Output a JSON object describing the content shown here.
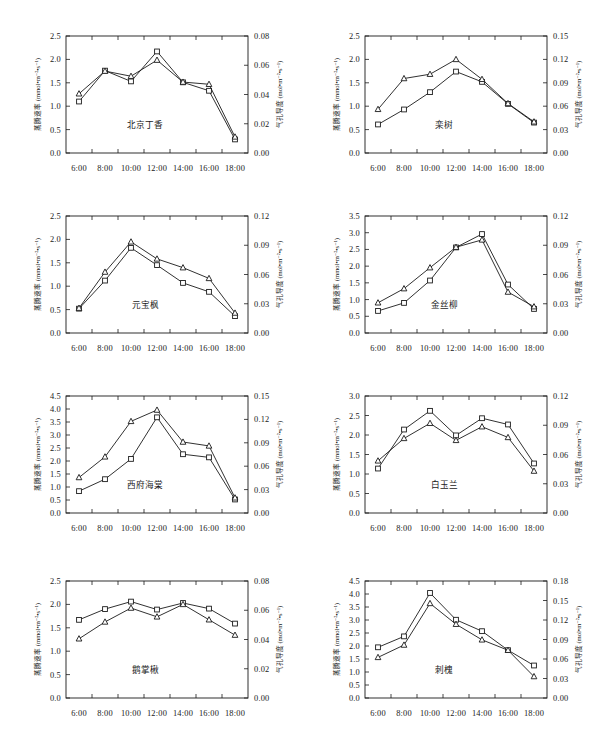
{
  "figure": {
    "axis_titles": {
      "left": "蒸腾速率 (mmol•m⁻²•s⁻¹)",
      "right": "气孔导度 (mol•m⁻²•s⁻¹)"
    },
    "x_categories": [
      "6:00",
      "8:00",
      "10:00",
      "12:00",
      "14:00",
      "16:00",
      "18:00"
    ],
    "series_names": [
      "蒸腾速率",
      "气孔导度"
    ],
    "marker_shapes": [
      "square",
      "triangle"
    ],
    "line_color": "#1a1a1a",
    "marker_fill": "#ffffff"
  },
  "chart_data": [
    {
      "type": "line",
      "title": "北京丁香",
      "xlabel": "",
      "ylabel": "蒸腾速率 (mmol•m⁻²•s⁻¹)",
      "y2label": "气孔导度 (mol•m⁻²•s⁻¹)",
      "categories": [
        "6:00",
        "8:00",
        "10:00",
        "12:00",
        "14:00",
        "16:00",
        "18:00"
      ],
      "ylim": [
        0.0,
        2.5
      ],
      "yticks": [
        "0.0",
        "0.5",
        "1.0",
        "1.5",
        "2.0",
        "2.5"
      ],
      "y2lim": [
        0.0,
        0.08
      ],
      "y2ticks": [
        "0.00",
        "0.02",
        "0.04",
        "0.06",
        "0.08"
      ],
      "grid": false,
      "legend": "none",
      "series": [
        {
          "name": "蒸腾速率",
          "marker": "square",
          "axis": "left",
          "values": [
            1.1,
            1.76,
            1.53,
            2.17,
            1.51,
            1.33,
            0.29
          ]
        },
        {
          "name": "气孔导度",
          "marker": "triangle",
          "axis": "right",
          "values": [
            0.0405,
            0.056,
            0.0525,
            0.0635,
            0.0485,
            0.047,
            0.011
          ]
        }
      ]
    },
    {
      "type": "line",
      "title": "栾树",
      "xlabel": "",
      "ylabel": "蒸腾速率 (mmol•m⁻²•s⁻¹)",
      "y2label": "气孔导度 (mol•m⁻²•s⁻¹)",
      "categories": [
        "6:00",
        "8:00",
        "10:00",
        "12:00",
        "14:00",
        "16:00",
        "18:00"
      ],
      "ylim": [
        0.0,
        2.5
      ],
      "yticks": [
        "0.0",
        "0.5",
        "1.0",
        "1.5",
        "2.0",
        "2.5"
      ],
      "y2lim": [
        0.0,
        0.15
      ],
      "y2ticks": [
        "0.00",
        "0.03",
        "0.06",
        "0.09",
        "0.12",
        "0.15"
      ],
      "grid": false,
      "legend": "none",
      "series": [
        {
          "name": "蒸腾速率",
          "marker": "square",
          "axis": "left",
          "values": [
            0.61,
            0.93,
            1.3,
            1.74,
            1.52,
            1.05,
            0.65
          ]
        },
        {
          "name": "气孔导度",
          "marker": "triangle",
          "axis": "right",
          "values": [
            0.056,
            0.0955,
            0.101,
            0.12,
            0.0945,
            0.0635,
            0.04
          ]
        }
      ]
    },
    {
      "type": "line",
      "title": "元宝枫",
      "xlabel": "",
      "ylabel": "蒸腾速率 (mmol•m⁻²•s⁻¹)",
      "y2label": "气孔导度 (mol•m⁻²•s⁻¹)",
      "categories": [
        "6:00",
        "8:00",
        "10:00",
        "12:00",
        "14:00",
        "16:00",
        "18:00"
      ],
      "ylim": [
        0.0,
        2.5
      ],
      "yticks": [
        "0.0",
        "0.5",
        "1.0",
        "1.5",
        "2.0",
        "2.5"
      ],
      "y2lim": [
        0.0,
        0.12
      ],
      "y2ticks": [
        "0.00",
        "0.03",
        "0.06",
        "0.09",
        "0.12"
      ],
      "grid": false,
      "legend": "none",
      "series": [
        {
          "name": "蒸腾速率",
          "marker": "square",
          "axis": "left",
          "values": [
            0.52,
            1.12,
            1.82,
            1.45,
            1.07,
            0.88,
            0.36
          ]
        },
        {
          "name": "气孔导度",
          "marker": "triangle",
          "axis": "right",
          "values": [
            0.0255,
            0.0625,
            0.0935,
            0.076,
            0.067,
            0.056,
            0.0205
          ]
        }
      ]
    },
    {
      "type": "line",
      "title": "金丝柳",
      "xlabel": "",
      "ylabel": "蒸腾速率 (mmol•m⁻²•s⁻¹)",
      "y2label": "气孔导度 (mol•m⁻²•s⁻¹)",
      "categories": [
        "6:00",
        "8:00",
        "10:00",
        "12:00",
        "14:00",
        "16:00",
        "18:00"
      ],
      "ylim": [
        0.0,
        3.5
      ],
      "yticks": [
        "0.0",
        "0.5",
        "1.0",
        "1.5",
        "2.0",
        "2.5",
        "3.0",
        "3.5"
      ],
      "y2lim": [
        0.0,
        0.12
      ],
      "y2ticks": [
        "0.00",
        "0.03",
        "0.06",
        "0.09",
        "0.12"
      ],
      "grid": false,
      "legend": "none",
      "series": [
        {
          "name": "蒸腾速率",
          "marker": "square",
          "axis": "left",
          "values": [
            0.66,
            0.9,
            1.57,
            2.56,
            2.96,
            1.45,
            0.72
          ]
        },
        {
          "name": "气孔导度",
          "marker": "triangle",
          "axis": "right",
          "values": [
            0.031,
            0.0455,
            0.067,
            0.088,
            0.0955,
            0.042,
            0.027
          ]
        }
      ]
    },
    {
      "type": "line",
      "title": "西府海棠",
      "xlabel": "",
      "ylabel": "蒸腾速率 (mmol•m⁻²•s⁻¹)",
      "y2label": "气孔导度 (mol•m⁻²•s⁻¹)",
      "categories": [
        "6:00",
        "8:00",
        "10:00",
        "12:00",
        "14:00",
        "16:00",
        "18:00"
      ],
      "ylim": [
        0.0,
        4.5
      ],
      "yticks": [
        "0.0",
        "0.5",
        "1.0",
        "1.5",
        "2.0",
        "2.5",
        "3.0",
        "3.5",
        "4.0",
        "4.5"
      ],
      "y2lim": [
        0.0,
        0.15
      ],
      "y2ticks": [
        "0.00",
        "0.03",
        "0.06",
        "0.09",
        "0.12",
        "0.15"
      ],
      "grid": false,
      "legend": "none",
      "series": [
        {
          "name": "蒸腾速率",
          "marker": "square",
          "axis": "left",
          "values": [
            0.84,
            1.3,
            2.08,
            3.68,
            2.26,
            2.14,
            0.52
          ]
        },
        {
          "name": "气孔导度",
          "marker": "triangle",
          "axis": "right",
          "values": [
            0.0455,
            0.072,
            0.1175,
            0.132,
            0.091,
            0.086,
            0.0195
          ]
        }
      ]
    },
    {
      "type": "line",
      "title": "白玉兰",
      "xlabel": "",
      "ylabel": "蒸腾速率 (mmol•m⁻²•s⁻¹)",
      "y2label": "气孔导度 (mol•m⁻²•s⁻¹)",
      "categories": [
        "6:00",
        "8:00",
        "10:00",
        "12:00",
        "14:00",
        "16:00",
        "18:00"
      ],
      "ylim": [
        0.0,
        3.0
      ],
      "yticks": [
        "0.0",
        "0.5",
        "1.0",
        "1.5",
        "2.0",
        "2.5",
        "3.0"
      ],
      "y2lim": [
        0.0,
        0.12
      ],
      "y2ticks": [
        "0.00",
        "0.03",
        "0.06",
        "0.09",
        "0.12"
      ],
      "grid": false,
      "legend": "none",
      "series": [
        {
          "name": "蒸腾速率",
          "marker": "square",
          "axis": "left",
          "values": [
            1.14,
            2.14,
            2.62,
            1.99,
            2.43,
            2.27,
            1.27
          ]
        },
        {
          "name": "气孔导度",
          "marker": "triangle",
          "axis": "right",
          "values": [
            0.0535,
            0.0765,
            0.092,
            0.0745,
            0.0885,
            0.0775,
            0.043
          ]
        }
      ]
    },
    {
      "type": "line",
      "title": "鹅掌楸",
      "xlabel": "",
      "ylabel": "蒸腾速率 (mmol•m⁻²•s⁻¹)",
      "y2label": "气孔导度 (mol•m⁻²•s⁻¹)",
      "categories": [
        "6:00",
        "8:00",
        "10:00",
        "12:00",
        "14:00",
        "16:00",
        "18:00"
      ],
      "ylim": [
        0.0,
        2.5
      ],
      "yticks": [
        "0.0",
        "0.5",
        "1.0",
        "1.5",
        "2.0",
        "2.5"
      ],
      "y2lim": [
        0.0,
        0.08
      ],
      "y2ticks": [
        "0.00",
        "0.02",
        "0.04",
        "0.06",
        "0.08"
      ],
      "grid": false,
      "legend": "none",
      "series": [
        {
          "name": "蒸腾速率",
          "marker": "square",
          "axis": "left",
          "values": [
            1.67,
            1.9,
            2.06,
            1.89,
            2.03,
            1.91,
            1.59
          ]
        },
        {
          "name": "气孔导度",
          "marker": "triangle",
          "axis": "right",
          "values": [
            0.0405,
            0.052,
            0.0615,
            0.0555,
            0.064,
            0.0535,
            0.043
          ]
        }
      ]
    },
    {
      "type": "line",
      "title": "刺槐",
      "xlabel": "",
      "ylabel": "蒸腾速率 (mmol•m⁻²•s⁻¹)",
      "y2label": "气孔导度 (mol•m⁻²•s⁻¹)",
      "categories": [
        "6:00",
        "8:00",
        "10:00",
        "12:00",
        "14:00",
        "16:00",
        "18:00"
      ],
      "ylim": [
        0.0,
        4.5
      ],
      "yticks": [
        "0.0",
        "0.5",
        "1.0",
        "1.5",
        "2.0",
        "2.5",
        "3.0",
        "3.5",
        "4.0",
        "4.5"
      ],
      "y2lim": [
        0.0,
        0.18
      ],
      "y2ticks": [
        "0.00",
        "0.03",
        "0.06",
        "0.09",
        "0.12",
        "0.15",
        "0.18"
      ],
      "grid": false,
      "legend": "none",
      "series": [
        {
          "name": "蒸腾速率",
          "marker": "square",
          "axis": "left",
          "values": [
            1.95,
            2.37,
            4.04,
            3.01,
            2.57,
            1.84,
            1.25
          ]
        },
        {
          "name": "气孔导度",
          "marker": "triangle",
          "axis": "right",
          "values": [
            0.0625,
            0.0815,
            0.1455,
            0.1135,
            0.0895,
            0.0735,
            0.033
          ]
        }
      ]
    }
  ]
}
